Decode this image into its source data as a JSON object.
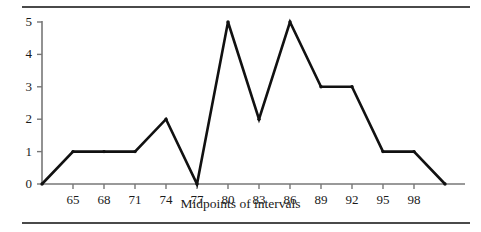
{
  "chart_data": {
    "type": "line",
    "title": "",
    "subtitle": "",
    "xlabel": "Midpoints of intervals",
    "ylabel": "",
    "categories": [
      62,
      65,
      68,
      71,
      74,
      77,
      80,
      83,
      86,
      89,
      92,
      95,
      98,
      101
    ],
    "values": [
      0,
      1,
      1,
      1,
      2,
      0,
      5,
      2,
      5,
      3,
      3,
      1,
      1,
      0
    ],
    "x_tick_labels": [
      "65",
      "68",
      "71",
      "74",
      "77",
      "80",
      "83",
      "86",
      "89",
      "92",
      "95",
      "98"
    ],
    "x_tick_values": [
      65,
      68,
      71,
      74,
      77,
      80,
      83,
      86,
      89,
      92,
      95,
      98
    ],
    "y_tick_labels": [
      "0",
      "1",
      "2",
      "3",
      "4",
      "5"
    ],
    "y_tick_values": [
      0,
      1,
      2,
      3,
      4,
      5
    ],
    "xlim": [
      62,
      101
    ],
    "ylim": [
      0,
      5
    ],
    "grid": false,
    "legend": false,
    "series": [
      {
        "name": "Frequency polygon",
        "values": [
          0,
          1,
          1,
          1,
          2,
          0,
          5,
          2,
          5,
          3,
          3,
          1,
          1,
          0
        ]
      }
    ],
    "line_color": "#111111",
    "marker": "dot",
    "axis_color": "#777777",
    "rule_color": "#4a4a4a"
  }
}
